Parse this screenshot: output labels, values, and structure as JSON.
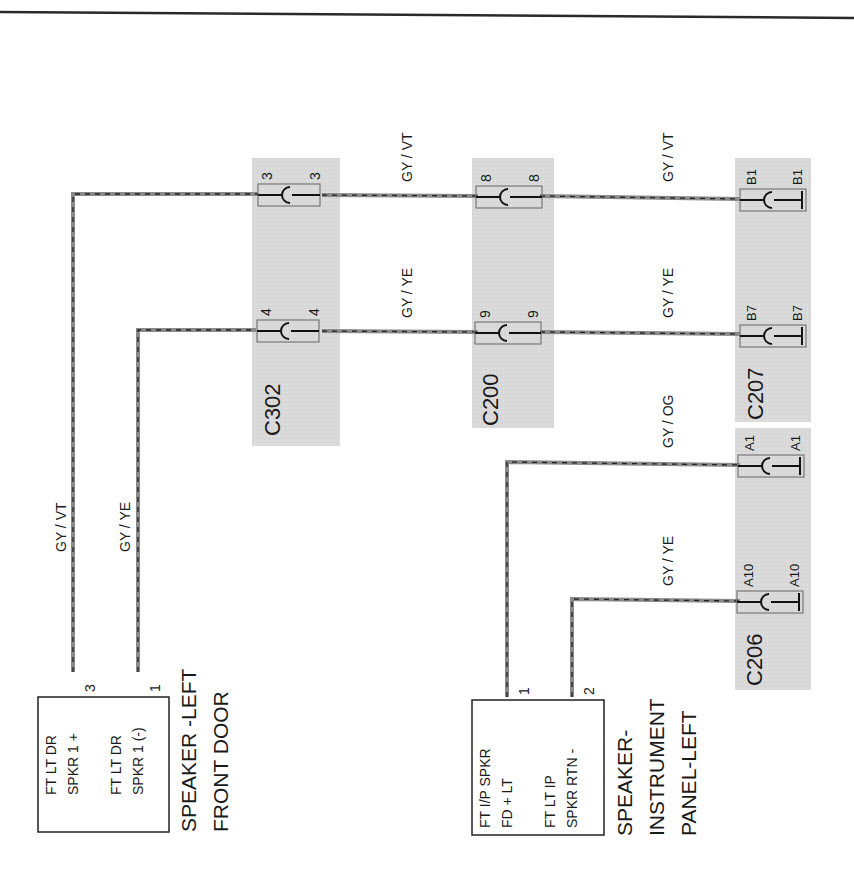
{
  "colors": {
    "background": "#ffffff",
    "connector_shade": "#d9d9d9",
    "wire_outer": "#8a8a8a",
    "wire_dash": "#222222",
    "ink": "#1a1a1a"
  },
  "connectors": [
    {
      "id": "C302",
      "pins": [
        {
          "in": "3",
          "out": "3"
        },
        {
          "in": "4",
          "out": "4"
        }
      ]
    },
    {
      "id": "C200",
      "pins": [
        {
          "in": "8",
          "out": "8"
        },
        {
          "in": "9",
          "out": "9"
        }
      ]
    },
    {
      "id": "C207",
      "pins": [
        {
          "in": "B1",
          "out": "B1"
        },
        {
          "in": "B7",
          "out": "B7"
        }
      ]
    },
    {
      "id": "C206",
      "pins": [
        {
          "in": "A1",
          "out": "A1"
        },
        {
          "in": "A10",
          "out": "A10"
        }
      ]
    }
  ],
  "wires": {
    "door_plus_vertical": "GY / VT",
    "door_minus_vertical": "GY / YE",
    "top_c302_c200": "GY / VT",
    "top_c200_c207": "GY / VT",
    "mid_c302_c200": "GY / YE",
    "mid_c200_c207": "GY / YE",
    "ip_a1": "GY / OG",
    "ip_a10": "GY / YE"
  },
  "components": {
    "door_speaker": {
      "pin_a_label": "FT LT DR",
      "pin_a_sub": "SPKR 1 +",
      "pin_a_num": "3",
      "pin_b_label": "FT LT DR",
      "pin_b_sub": "SPKR 1 (-)",
      "pin_b_num": "1",
      "title_line1": "SPEAKER -LEFT",
      "title_line2": "FRONT DOOR"
    },
    "ip_speaker": {
      "pin_a_label": "FT I/P SPKR",
      "pin_a_sub": "FD + LT",
      "pin_a_num": "1",
      "pin_b_label": "FT LT IP",
      "pin_b_sub": "SPKR RTN -",
      "pin_b_num": "2",
      "title_line1": "SPEAKER-",
      "title_line2": "INSTRUMENT",
      "title_line3": "PANEL-LEFT"
    }
  }
}
